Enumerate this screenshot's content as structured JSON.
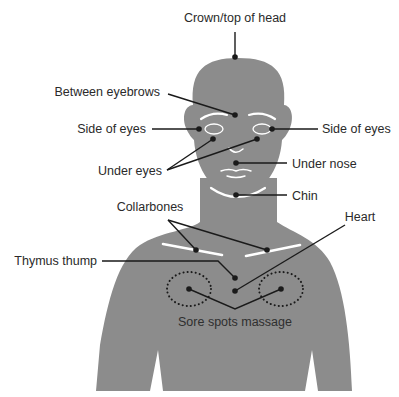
{
  "diagram": {
    "type": "tapping-points-figure",
    "colors": {
      "body": "#8c8c8c",
      "feature_lines": "#ffffff",
      "leader_lines": "#1a1a1a",
      "text": "#2a2a2a",
      "background": "#ffffff"
    },
    "labels": {
      "crown": "Crown/top of head",
      "between_eyebrows": "Between eyebrows",
      "side_of_eyes_left": "Side of eyes",
      "side_of_eyes_right": "Side of eyes",
      "under_eyes": "Under eyes",
      "under_nose": "Under nose",
      "chin": "Chin",
      "collarbones": "Collarbones",
      "heart": "Heart",
      "thymus_thump": "Thymus thump",
      "sore_spots": "Sore spots massage"
    }
  }
}
